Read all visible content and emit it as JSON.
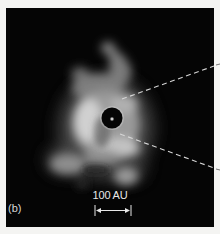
{
  "figure": {
    "panel_label": "(b)",
    "scale_bar": {
      "label": "100 AU",
      "length_px": 36
    },
    "elements": {
      "central_star": "star-with-coronagraph-mask",
      "zoom_lines": "dashed-callout-lines"
    },
    "colors": {
      "background": "#050505",
      "page": "#f4f4f2",
      "nebula_highlight": "#d9d9d9",
      "annotation": "#e8e8e8"
    }
  }
}
